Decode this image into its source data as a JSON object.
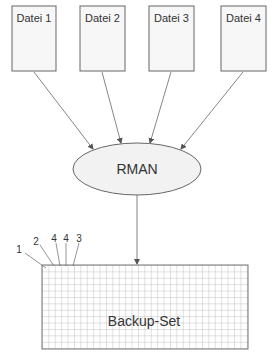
{
  "diagram": {
    "files": [
      {
        "label": "Datei 1"
      },
      {
        "label": "Datei 2"
      },
      {
        "label": "Datei 3"
      },
      {
        "label": "Datei 4"
      }
    ],
    "process": {
      "label": "RMAN"
    },
    "output": {
      "label": "Backup-Set"
    },
    "block_markers": [
      "1",
      "2",
      "4",
      "4",
      "3"
    ],
    "colors": {
      "stroke": "#666666",
      "file_fill": "#f7f7f7",
      "ellipse_fill": "#f2f2f2",
      "grid": "#aaaaaa",
      "text": "#333333"
    }
  }
}
